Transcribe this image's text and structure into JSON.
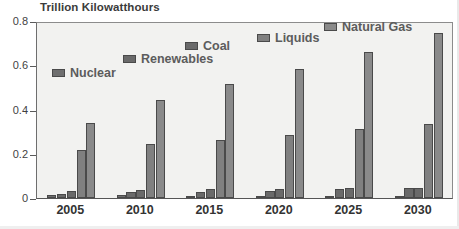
{
  "chart_data": {
    "type": "bar",
    "title": "Trillion Kilowatthours",
    "subtitle": "",
    "xlabel": "",
    "ylabel": "",
    "ylim": [
      0,
      0.8
    ],
    "ytick_labels": [
      "0",
      "0.2",
      "0.4",
      "0.6",
      "0.8"
    ],
    "ytick_values": [
      0,
      0.2,
      0.4,
      0.6,
      0.8
    ],
    "grid": false,
    "legend_position": "inside-staircase",
    "categories": [
      "2005",
      "2010",
      "2015",
      "2020",
      "2025",
      "2030"
    ],
    "series": [
      {
        "name": "Nuclear",
        "color": "#6f6f6f",
        "values": [
          0.013,
          0.013,
          0.007,
          0.008,
          0.009,
          0.009
        ]
      },
      {
        "name": "Renewables",
        "color": "#6a6a6a",
        "values": [
          0.018,
          0.026,
          0.027,
          0.032,
          0.039,
          0.044
        ]
      },
      {
        "name": "Coal",
        "color": "#6a6a6a",
        "values": [
          0.03,
          0.037,
          0.042,
          0.042,
          0.044,
          0.045
        ]
      },
      {
        "name": "Liquids",
        "color": "#808080",
        "values": [
          0.216,
          0.242,
          0.264,
          0.286,
          0.312,
          0.336
        ]
      },
      {
        "name": "Natural Gas",
        "color": "#8a8a8a",
        "values": [
          0.34,
          0.443,
          0.515,
          0.583,
          0.659,
          0.744
        ]
      }
    ]
  },
  "legend": {
    "entries": [
      {
        "label": "Nuclear"
      },
      {
        "label": "Renewables"
      },
      {
        "label": "Coal"
      },
      {
        "label": "Liquids"
      },
      {
        "label": "Natural Gas"
      }
    ]
  },
  "axis": {
    "y_ticks": [
      {
        "label": "0.8"
      },
      {
        "label": "0.6"
      },
      {
        "label": "0.4"
      },
      {
        "label": "0.2"
      },
      {
        "label": "0"
      }
    ],
    "x_ticks": [
      {
        "label": "2005"
      },
      {
        "label": "2010"
      },
      {
        "label": "2015"
      },
      {
        "label": "2020"
      },
      {
        "label": "2025"
      },
      {
        "label": "2030"
      }
    ]
  }
}
